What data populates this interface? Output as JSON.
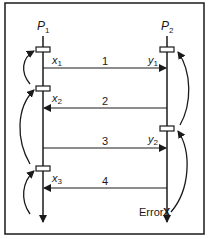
{
  "diagram": {
    "processes": [
      {
        "id": "p1",
        "label": "P",
        "subscript": "1"
      },
      {
        "id": "p2",
        "label": "P",
        "subscript": "2"
      }
    ],
    "checkpoints": [
      {
        "process": "p1",
        "label": "x",
        "subscript": "1"
      },
      {
        "process": "p1",
        "label": "x",
        "subscript": "2"
      },
      {
        "process": "p1",
        "label": "x",
        "subscript": "3"
      },
      {
        "process": "p2",
        "label": "y",
        "subscript": "1"
      },
      {
        "process": "p2",
        "label": "y",
        "subscript": "2"
      }
    ],
    "messages": [
      {
        "label": "1",
        "from": "p1",
        "to": "p2"
      },
      {
        "label": "2",
        "from": "p2",
        "to": "p1"
      },
      {
        "label": "3",
        "from": "p1",
        "to": "p2"
      },
      {
        "label": "4",
        "from": "p2",
        "to": "p1"
      }
    ],
    "error": {
      "process": "p2",
      "label": "Error",
      "marker": "X"
    }
  }
}
